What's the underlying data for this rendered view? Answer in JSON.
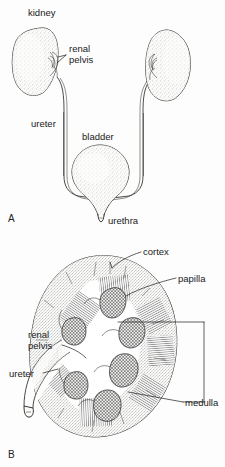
{
  "figure": {
    "background_color": "#fdfdfd",
    "ink_color": "#1d1d1d",
    "type": "anatomical-line-drawing"
  },
  "panels": [
    {
      "id": "A",
      "label": "A",
      "caption": "Urinary tract overview",
      "labels": [
        {
          "name": "kidney",
          "text": "kidney",
          "lines": [
            "kidney"
          ]
        },
        {
          "name": "renal-pelvis",
          "text": "renal pelvis",
          "lines": [
            "renal",
            "pelvis"
          ]
        },
        {
          "name": "ureter",
          "text": "ureter",
          "lines": [
            "ureter"
          ]
        },
        {
          "name": "bladder",
          "text": "bladder",
          "lines": [
            "bladder"
          ]
        },
        {
          "name": "urethra",
          "text": "urethra",
          "lines": [
            "urethra"
          ]
        }
      ]
    },
    {
      "id": "B",
      "label": "B",
      "caption": "Kidney in coronal section",
      "labels": [
        {
          "name": "cortex",
          "text": "cortex",
          "lines": [
            "cortex"
          ]
        },
        {
          "name": "papilla",
          "text": "papilla",
          "lines": [
            "papilla"
          ]
        },
        {
          "name": "renal-pelvis",
          "text": "renal pelvis",
          "lines": [
            "renal",
            "pelvis"
          ]
        },
        {
          "name": "ureter",
          "text": "ureter",
          "lines": [
            "ureter"
          ]
        },
        {
          "name": "medulla",
          "text": "medulla",
          "lines": [
            "medulla"
          ]
        }
      ]
    }
  ],
  "text": {
    "kidney": "kidney",
    "renal": "renal",
    "pelvis": "pelvis",
    "ureter": "ureter",
    "bladder": "bladder",
    "urethra": "urethra",
    "cortex": "cortex",
    "papilla": "papilla",
    "medulla": "medulla",
    "panelA": "A",
    "panelB": "B"
  }
}
